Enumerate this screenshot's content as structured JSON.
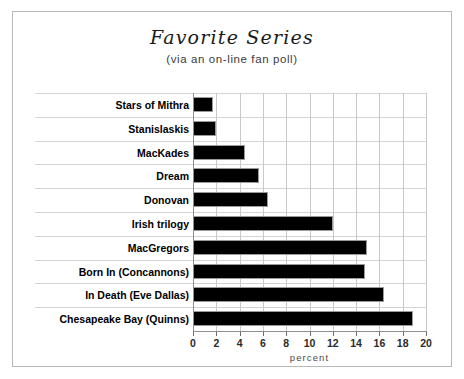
{
  "chart_data": {
    "type": "bar",
    "orientation": "horizontal",
    "title": "Favorite Series",
    "subtitle": "(via an on-line fan poll)",
    "xlabel": "percent",
    "ylabel": "",
    "xlim": [
      0,
      20
    ],
    "xticks": [
      0,
      2,
      4,
      6,
      8,
      10,
      12,
      14,
      16,
      18,
      20
    ],
    "grid": true,
    "legend": false,
    "bar_color": "#000000",
    "categories": [
      "Stars of Mithra",
      "Stanislaskis",
      "MacKades",
      "Dream",
      "Donovan",
      "Irish trilogy",
      "MacGregors",
      "Born In (Concannons)",
      "In Death (Eve Dallas)",
      "Chesapeake Bay (Quinns)"
    ],
    "values": [
      1.7,
      2.0,
      4.5,
      5.7,
      6.4,
      12.0,
      14.9,
      14.8,
      16.4,
      18.9
    ]
  }
}
